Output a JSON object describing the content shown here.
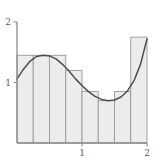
{
  "figure": {
    "title": "",
    "axis_color": "#8a8a8a",
    "bar_fill": "#ececec",
    "bar_stroke": "#9a9a9a",
    "curve_color": "#4d4d4d",
    "label_color": "#5a5a5a"
  },
  "axes": {
    "y_ticks": [
      {
        "value": 1,
        "label": "1"
      },
      {
        "value": 2,
        "label": "2"
      }
    ],
    "x_ticks": [
      {
        "value": 1,
        "label": "1"
      },
      {
        "value": 2,
        "label": "2"
      }
    ]
  },
  "chart_data": {
    "type": "bar",
    "title": "",
    "xlabel": "",
    "ylabel": "",
    "xlim": [
      0,
      2
    ],
    "ylim": [
      0,
      2
    ],
    "grid": false,
    "legend": "none",
    "bar_edges": [
      0,
      0.25,
      0.5,
      0.75,
      1.0,
      1.25,
      1.5,
      1.75,
      2.0
    ],
    "categories": [
      "0-0.25",
      "0.25-0.5",
      "0.5-0.75",
      "0.75-1.0",
      "1.0-1.25",
      "1.25-1.5",
      "1.5-1.75",
      "1.75-2.0"
    ],
    "values": [
      1.45,
      1.45,
      1.45,
      1.2,
      0.85,
      0.7,
      0.85,
      1.75
    ],
    "series": [
      {
        "name": "Riemann rectangles",
        "values": [
          1.45,
          1.45,
          1.45,
          1.2,
          0.85,
          0.7,
          0.85,
          1.75
        ]
      },
      {
        "name": "curve",
        "x": [
          0.0,
          0.1,
          0.2,
          0.3,
          0.4,
          0.5,
          0.6,
          0.7,
          0.8,
          0.9,
          1.0,
          1.1,
          1.2,
          1.3,
          1.4,
          1.5,
          1.6,
          1.7,
          1.8,
          1.9,
          2.0
        ],
        "y": [
          1.06,
          1.22,
          1.35,
          1.43,
          1.45,
          1.44,
          1.39,
          1.3,
          1.19,
          1.06,
          0.95,
          0.85,
          0.77,
          0.72,
          0.7,
          0.71,
          0.76,
          0.86,
          1.03,
          1.3,
          1.72
        ]
      }
    ]
  }
}
